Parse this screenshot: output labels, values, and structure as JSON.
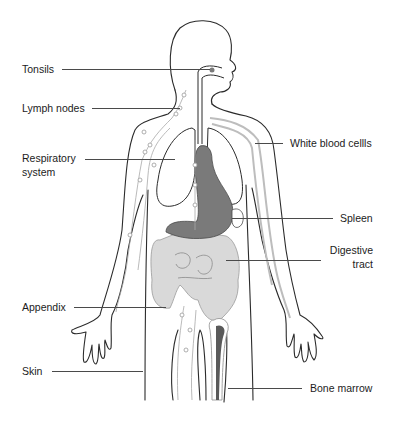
{
  "figure": {
    "colors": {
      "outline": "#2b2b2b",
      "lymph_vessel": "#9a9a9a",
      "white_blood_cell_vessel": "#b8b8b8",
      "organ_light": "#d9d9d9",
      "organ_dark": "#7a7a7a",
      "lung_fill": "#ffffff",
      "leader_line": "#4a4a4a",
      "text": "#1c1c1c"
    },
    "labels": {
      "tonsils": "Tonsils",
      "lymph_nodes": "Lymph nodes",
      "respiratory_1": "Respiratory",
      "respiratory_2": "system",
      "white_blood_cells": "White blood cellls",
      "spleen": "Spleen",
      "digestive_1": "Digestive",
      "digestive_2": "tract",
      "appendix": "Appendix",
      "skin": "Skin",
      "bone_marrow": "Bone marrow"
    }
  }
}
